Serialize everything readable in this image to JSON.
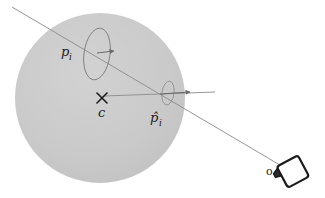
{
  "figure": {
    "type": "geometry-diagram",
    "title": "",
    "background_color": "#ffffff"
  },
  "sphere": {
    "name": "shape-sphere",
    "center_x": 100,
    "center_y": 98,
    "radius": 85,
    "fill_color": "#c9c9c9",
    "stroke": "none"
  },
  "center_marker": {
    "name": "center-cross",
    "x": 102,
    "y": 98,
    "glyph": "×",
    "color": "#1b1b1b"
  },
  "labels": {
    "center": {
      "text": "c",
      "sub": "",
      "x": 99,
      "y": 116
    },
    "point_pi": {
      "text": "p",
      "sub": "i",
      "x": 62,
      "y": 57
    },
    "point_pihat": {
      "text": "p̂",
      "sub": "i",
      "x": 150,
      "y": 122
    },
    "origin": {
      "text": "o",
      "x": 268,
      "y": 174
    }
  },
  "ellipses": [
    {
      "name": "ellipse-pi",
      "cx": 97,
      "cy": 54,
      "rx": 13,
      "ry": 26,
      "rotation": 8,
      "stroke_color": "#7d7d7d"
    },
    {
      "name": "ellipse-pihat",
      "cx": 168,
      "cy": 93,
      "rx": 6,
      "ry": 12,
      "rotation": 8,
      "stroke_color": "#8c8c8c"
    }
  ],
  "arrows": [
    {
      "name": "normal-arrow-pi",
      "x1": 97,
      "y1": 53,
      "x2": 116,
      "y2": 51,
      "color": "#6a6a6a"
    },
    {
      "name": "normal-arrow-pihat",
      "x1": 160,
      "y1": 94,
      "x2": 192,
      "y2": 92,
      "color": "#6a6a6a"
    }
  ],
  "lines": [
    {
      "name": "view-ray",
      "x1": 12,
      "y1": 7,
      "x2": 285,
      "y2": 168,
      "color": "#8a8a8a",
      "width": 0.9
    },
    {
      "name": "center-to-pihat-ray",
      "x1": 104,
      "y1": 96,
      "x2": 215,
      "y2": 92,
      "color": "#8a8a8a",
      "width": 0.9
    }
  ],
  "camera": {
    "name": "camera-icon",
    "body_cx": 292,
    "body_cy": 172,
    "size": 25,
    "rotation": -28,
    "stroke_color": "#1b1b1b",
    "fill_color": "#ffffff",
    "lens_color": "#2b2b2b"
  }
}
